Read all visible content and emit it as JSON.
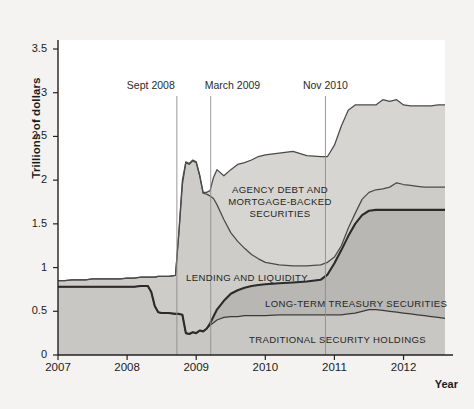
{
  "chart_data": {
    "type": "area",
    "stacked": true,
    "title": "",
    "xlabel": "Year",
    "ylabel": "Trillions of dollars",
    "xlim": [
      2007.0,
      2012.6
    ],
    "ylim": [
      0,
      3.7
    ],
    "yticks": [
      0,
      0.5,
      1,
      1.5,
      2,
      2.5,
      3,
      3.5
    ],
    "ytick_labels": [
      "0",
      "0.5",
      "1",
      "1.5",
      "2",
      "2.5",
      "3",
      "3.5"
    ],
    "xticks": [
      2007,
      2008,
      2009,
      2010,
      2011,
      2012
    ],
    "xtick_labels": [
      "2007",
      "2008",
      "2009",
      "2010",
      "2011",
      "2012"
    ],
    "grid": false,
    "legend": "inline-labels",
    "series": [
      {
        "name": "TRADITIONAL SECURITY HOLDINGS",
        "label_x": 2010.15,
        "label_y": 0.18,
        "fill": "#c8c7c3",
        "line": "#3a3a3a",
        "x": [
          2007.0,
          2007.1,
          2007.2,
          2007.3,
          2007.4,
          2007.5,
          2007.6,
          2007.7,
          2007.8,
          2007.9,
          2008.0,
          2008.1,
          2008.2,
          2008.3,
          2008.35,
          2008.4,
          2008.45,
          2008.5,
          2008.6,
          2008.7,
          2008.75,
          2008.8,
          2008.85,
          2008.9,
          2008.95,
          2009.0,
          2009.05,
          2009.1,
          2009.15,
          2009.2,
          2009.25,
          2009.3,
          2009.4,
          2009.5,
          2009.6,
          2009.7,
          2009.8,
          2009.9,
          2010.0,
          2010.2,
          2010.4,
          2010.6,
          2010.8,
          2010.9,
          2011.0,
          2011.1,
          2011.2,
          2011.3,
          2011.4,
          2011.5,
          2011.6,
          2011.7,
          2011.8,
          2011.9,
          2012.0,
          2012.1,
          2012.2,
          2012.3,
          2012.4,
          2012.5,
          2012.6
        ],
        "y": [
          0.78,
          0.78,
          0.78,
          0.78,
          0.78,
          0.78,
          0.78,
          0.78,
          0.78,
          0.78,
          0.78,
          0.78,
          0.79,
          0.79,
          0.72,
          0.56,
          0.49,
          0.48,
          0.48,
          0.47,
          0.47,
          0.46,
          0.25,
          0.24,
          0.26,
          0.25,
          0.28,
          0.27,
          0.3,
          0.34,
          0.37,
          0.4,
          0.43,
          0.44,
          0.44,
          0.45,
          0.45,
          0.45,
          0.45,
          0.46,
          0.46,
          0.46,
          0.46,
          0.46,
          0.46,
          0.46,
          0.47,
          0.48,
          0.5,
          0.52,
          0.52,
          0.51,
          0.5,
          0.49,
          0.48,
          0.47,
          0.46,
          0.45,
          0.44,
          0.43,
          0.42
        ]
      },
      {
        "name": "LONG-TERM TREASURY SECURITIES",
        "label_x": 2010.6,
        "label_y": 0.62,
        "fill": "#b8b7b3",
        "line": "#2b2b2b",
        "cumulative_y": [
          0.78,
          0.78,
          0.78,
          0.78,
          0.78,
          0.78,
          0.78,
          0.78,
          0.78,
          0.78,
          0.78,
          0.78,
          0.79,
          0.79,
          0.72,
          0.56,
          0.49,
          0.48,
          0.48,
          0.47,
          0.47,
          0.46,
          0.25,
          0.24,
          0.26,
          0.25,
          0.28,
          0.27,
          0.3,
          0.36,
          0.44,
          0.52,
          0.62,
          0.7,
          0.74,
          0.77,
          0.79,
          0.8,
          0.81,
          0.82,
          0.83,
          0.84,
          0.86,
          0.92,
          1.05,
          1.2,
          1.36,
          1.5,
          1.6,
          1.65,
          1.66,
          1.66,
          1.66,
          1.66,
          1.66,
          1.66,
          1.66,
          1.66,
          1.66,
          1.66,
          1.66
        ]
      },
      {
        "name": "LENDING AND LIQUIDITY",
        "label_x": 2009.0,
        "label_y": 0.96,
        "fill": "#cdccc8",
        "line": "#4a4a4a",
        "cumulative_y": [
          0.85,
          0.85,
          0.86,
          0.86,
          0.86,
          0.87,
          0.87,
          0.87,
          0.87,
          0.87,
          0.88,
          0.88,
          0.89,
          0.89,
          0.89,
          0.89,
          0.9,
          0.9,
          0.9,
          0.91,
          1.4,
          1.95,
          2.2,
          2.18,
          2.22,
          2.2,
          2.05,
          1.85,
          1.84,
          1.82,
          1.79,
          1.72,
          1.55,
          1.4,
          1.3,
          1.22,
          1.15,
          1.1,
          1.06,
          1.03,
          1.02,
          1.02,
          1.03,
          1.06,
          1.12,
          1.25,
          1.45,
          1.62,
          1.78,
          1.86,
          1.89,
          1.9,
          1.92,
          1.97,
          1.95,
          1.94,
          1.93,
          1.92,
          1.92,
          1.92,
          1.92
        ]
      },
      {
        "name": "AGENCY DEBT AND MORTGAGE-BACKED SECURITIES",
        "label_x": 2010.05,
        "label_y": 1.98,
        "fill": "#d6d5d1",
        "line": "#4a4a4a",
        "cumulative_y": [
          0.85,
          0.85,
          0.86,
          0.86,
          0.86,
          0.87,
          0.87,
          0.87,
          0.87,
          0.87,
          0.88,
          0.88,
          0.89,
          0.89,
          0.89,
          0.89,
          0.9,
          0.9,
          0.9,
          0.91,
          1.42,
          2.0,
          2.21,
          2.19,
          2.23,
          2.21,
          2.06,
          1.86,
          1.86,
          1.88,
          2.03,
          2.12,
          2.05,
          2.12,
          2.18,
          2.2,
          2.23,
          2.27,
          2.29,
          2.31,
          2.33,
          2.28,
          2.27,
          2.27,
          2.4,
          2.62,
          2.8,
          2.86,
          2.86,
          2.86,
          2.86,
          2.92,
          2.9,
          2.92,
          2.86,
          2.85,
          2.85,
          2.85,
          2.85,
          2.86,
          2.86
        ]
      }
    ],
    "annotations": [
      {
        "label": "Sept 2008",
        "x": 2008.72,
        "label_anchor": "end"
      },
      {
        "label": "March 2009",
        "x": 2009.21,
        "label_anchor": "start"
      },
      {
        "label": "Nov 2010",
        "x": 2010.87,
        "label_anchor": "middle"
      }
    ]
  },
  "labels": {
    "agency_line1": "AGENCY DEBT AND",
    "agency_line2": "MORTGAGE-BACKED",
    "agency_line3": "SECURITIES",
    "lending": "LENDING AND LIQUIDITY",
    "treasury": "LONG-TERM TREASURY SECURITIES",
    "traditional": "TRADITIONAL SECURITY HOLDINGS"
  }
}
